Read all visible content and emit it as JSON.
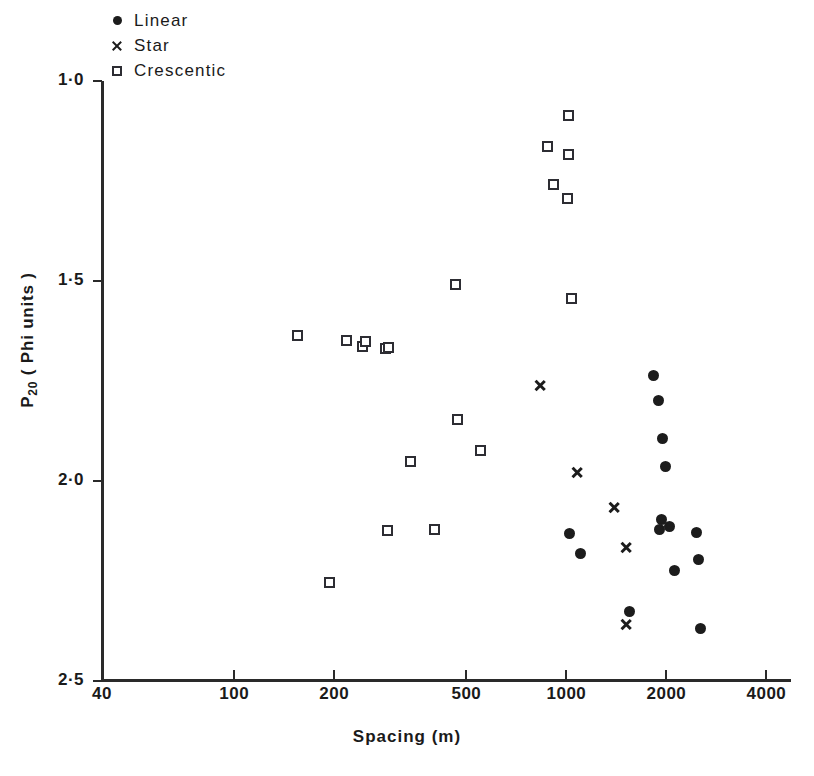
{
  "chart_data": {
    "type": "scatter",
    "title": "",
    "xlabel": "Spacing  (m)",
    "ylabel": "P20 ( Phi units )",
    "ylabel_base": "P",
    "ylabel_sub": "20",
    "ylabel_rest": " ( Phi  units )",
    "xscale": "log",
    "yscale": "linear",
    "xlim": [
      40,
      4000
    ],
    "ylim": [
      1.0,
      2.5
    ],
    "y_inverted": true,
    "grid": false,
    "legend_position": "top-left",
    "xticks": [
      40,
      100,
      200,
      500,
      1000,
      2000,
      4000
    ],
    "xtick_labels": [
      "40",
      "100",
      "200",
      "500",
      "1000",
      "2000",
      "4000"
    ],
    "yticks": [
      1.0,
      1.5,
      2.0,
      2.5
    ],
    "ytick_labels": [
      "1·0",
      "1·5",
      "2·0",
      "2·5"
    ],
    "marker_color": "#1c1c1c",
    "series": [
      {
        "name": "Linear",
        "marker": "filled-circle",
        "color": "#1c1c1c",
        "points": [
          {
            "x": 1830,
            "y": 1.735
          },
          {
            "x": 1900,
            "y": 1.798
          },
          {
            "x": 1945,
            "y": 1.893
          },
          {
            "x": 1985,
            "y": 1.963
          },
          {
            "x": 1020,
            "y": 2.13
          },
          {
            "x": 1105,
            "y": 2.18
          },
          {
            "x": 1930,
            "y": 2.095
          },
          {
            "x": 1905,
            "y": 2.12
          },
          {
            "x": 2050,
            "y": 2.113
          },
          {
            "x": 2470,
            "y": 2.128
          },
          {
            "x": 2490,
            "y": 2.195
          },
          {
            "x": 2115,
            "y": 2.223
          },
          {
            "x": 1550,
            "y": 2.325
          },
          {
            "x": 2540,
            "y": 2.368
          }
        ]
      },
      {
        "name": "Star",
        "marker": "cross-x",
        "color": "#1c1c1c",
        "points": [
          {
            "x": 830,
            "y": 1.76
          },
          {
            "x": 1080,
            "y": 1.978
          },
          {
            "x": 1390,
            "y": 2.065
          },
          {
            "x": 1515,
            "y": 2.165
          },
          {
            "x": 1515,
            "y": 2.358
          }
        ]
      },
      {
        "name": "Crescentic",
        "marker": "open-square",
        "color": "#2d2d33",
        "points": [
          {
            "x": 1015,
            "y": 1.085
          },
          {
            "x": 875,
            "y": 1.163
          },
          {
            "x": 1015,
            "y": 1.183
          },
          {
            "x": 915,
            "y": 1.258
          },
          {
            "x": 1010,
            "y": 1.293
          },
          {
            "x": 218,
            "y": 1.648
          },
          {
            "x": 243,
            "y": 1.663
          },
          {
            "x": 285,
            "y": 1.668
          },
          {
            "x": 465,
            "y": 1.508
          },
          {
            "x": 1035,
            "y": 1.543
          },
          {
            "x": 155,
            "y": 1.635
          },
          {
            "x": 248,
            "y": 1.65
          },
          {
            "x": 292,
            "y": 1.665
          },
          {
            "x": 470,
            "y": 1.845
          },
          {
            "x": 550,
            "y": 1.923
          },
          {
            "x": 340,
            "y": 1.95
          },
          {
            "x": 290,
            "y": 2.123
          },
          {
            "x": 400,
            "y": 2.12
          },
          {
            "x": 193,
            "y": 2.253
          }
        ]
      }
    ]
  },
  "legend": {
    "items": [
      {
        "label": "Linear",
        "marker": "filled-circle"
      },
      {
        "label": "Star",
        "marker": "cross-x"
      },
      {
        "label": "Crescentic",
        "marker": "open-square"
      }
    ]
  },
  "axes": {
    "x_title": "Spacing  (m)",
    "y_title_main": "P",
    "y_title_sub": "20",
    "y_title_rest": "( Phi  units )"
  }
}
